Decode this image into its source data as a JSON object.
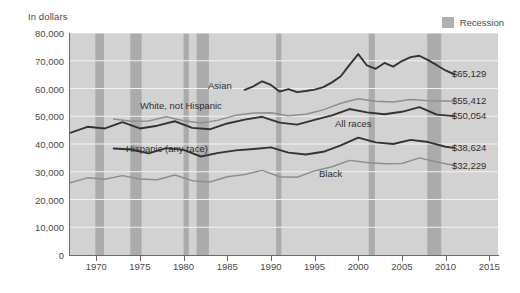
{
  "chart_data": {
    "type": "line",
    "title": "",
    "ylabel": "In dollars",
    "xlabel": "",
    "ylim": [
      0,
      80000
    ],
    "xlim": [
      1967,
      2016
    ],
    "grid": "horizontal",
    "legend_position": "top-right",
    "legend_entries": [
      {
        "label": "Recession",
        "color": "#b0b0b0",
        "kind": "band"
      }
    ],
    "y_ticks": [
      "0",
      "10,000",
      "20,000",
      "30,000",
      "40,000",
      "50,000",
      "60,000",
      "70,000",
      "80,000"
    ],
    "y_tick_values": [
      0,
      10000,
      20000,
      30000,
      40000,
      50000,
      60000,
      70000,
      80000
    ],
    "x_ticks": [
      "1970",
      "1975",
      "1980",
      "1985",
      "1990",
      "1995",
      "2000",
      "2005",
      "2010",
      "2015"
    ],
    "x_tick_values": [
      1970,
      1975,
      1980,
      1985,
      1990,
      1995,
      2000,
      2005,
      2010,
      2015
    ],
    "recession_bands": [
      [
        1969.9,
        1970.9
      ],
      [
        1973.9,
        1975.2
      ],
      [
        1980.0,
        1980.6
      ],
      [
        1981.5,
        1982.9
      ],
      [
        1990.6,
        1991.2
      ],
      [
        2001.2,
        2001.9
      ],
      [
        2007.9,
        2009.5
      ]
    ],
    "series": [
      {
        "name": "Asian",
        "color": "#333333",
        "end_label": "$65,129",
        "x": [
          1987,
          1988,
          1989,
          1990,
          1991,
          1992,
          1993,
          1994,
          1995,
          1996,
          1997,
          1998,
          1999,
          2000,
          2001,
          2002,
          2003,
          2004,
          2005,
          2006,
          2007,
          2008,
          2009,
          2010,
          2011
        ],
        "values": [
          59500,
          60800,
          62600,
          61300,
          58900,
          59800,
          58700,
          59100,
          59600,
          60500,
          62200,
          64400,
          68500,
          72400,
          68300,
          67100,
          69200,
          67900,
          69900,
          71300,
          71800,
          70200,
          68400,
          66500,
          65129
        ]
      },
      {
        "name": "White, not Hispanic",
        "color": "#8e8e8e",
        "end_label": "$55,412",
        "x": [
          1972,
          1974,
          1976,
          1978,
          1980,
          1982,
          1984,
          1986,
          1988,
          1990,
          1992,
          1994,
          1996,
          1998,
          2000,
          2002,
          2004,
          2006,
          2008,
          2010,
          2011
        ],
        "values": [
          49000,
          48200,
          48300,
          49800,
          48400,
          47600,
          48600,
          50400,
          51200,
          51300,
          50200,
          50700,
          52300,
          54700,
          56300,
          55400,
          55100,
          56000,
          55600,
          55500,
          55412
        ]
      },
      {
        "name": "All races",
        "color": "#333333",
        "end_label": "$50,054",
        "x": [
          1967,
          1969,
          1971,
          1973,
          1975,
          1977,
          1979,
          1981,
          1983,
          1985,
          1987,
          1989,
          1991,
          1993,
          1995,
          1997,
          1999,
          2001,
          2003,
          2005,
          2007,
          2009,
          2011
        ],
        "values": [
          44000,
          46200,
          45600,
          47900,
          45600,
          46600,
          48200,
          45800,
          45300,
          47400,
          48800,
          49800,
          47700,
          47000,
          48700,
          50300,
          52600,
          51400,
          50700,
          51600,
          53300,
          50600,
          50054
        ]
      },
      {
        "name": "Hispanic (any race)",
        "color": "#333333",
        "end_label": "$38,624",
        "x": [
          1972,
          1974,
          1976,
          1978,
          1980,
          1982,
          1984,
          1986,
          1988,
          1990,
          1992,
          1994,
          1996,
          1998,
          2000,
          2002,
          2004,
          2006,
          2008,
          2010,
          2011
        ],
        "values": [
          38400,
          38000,
          36600,
          38500,
          37900,
          35500,
          36800,
          37700,
          38200,
          38800,
          36900,
          36200,
          37200,
          39500,
          42300,
          40600,
          40000,
          41500,
          40700,
          39000,
          38624
        ]
      },
      {
        "name": "Black",
        "color": "#8e8e8e",
        "end_label": "$32,229",
        "x": [
          1967,
          1969,
          1971,
          1973,
          1975,
          1977,
          1979,
          1981,
          1983,
          1985,
          1987,
          1989,
          1991,
          1993,
          1995,
          1997,
          1999,
          2001,
          2003,
          2005,
          2007,
          2009,
          2011
        ],
        "values": [
          26000,
          27800,
          27300,
          28600,
          27400,
          27100,
          28800,
          26800,
          26300,
          28200,
          29000,
          30500,
          28200,
          28000,
          30300,
          31800,
          34100,
          33300,
          32900,
          33000,
          35000,
          33500,
          32229
        ]
      }
    ],
    "series_annotations": [
      {
        "text": "Asian",
        "x_px": 208,
        "y_px": 80
      },
      {
        "text": "White, not Hispanic",
        "x_px": 140,
        "y_px": 100
      },
      {
        "text": "All races",
        "x_px": 335,
        "y_px": 118
      },
      {
        "text": "Hispanic (any race)",
        "x_px": 126,
        "y_px": 143
      },
      {
        "text": "Black",
        "x_px": 319,
        "y_px": 168
      }
    ]
  }
}
